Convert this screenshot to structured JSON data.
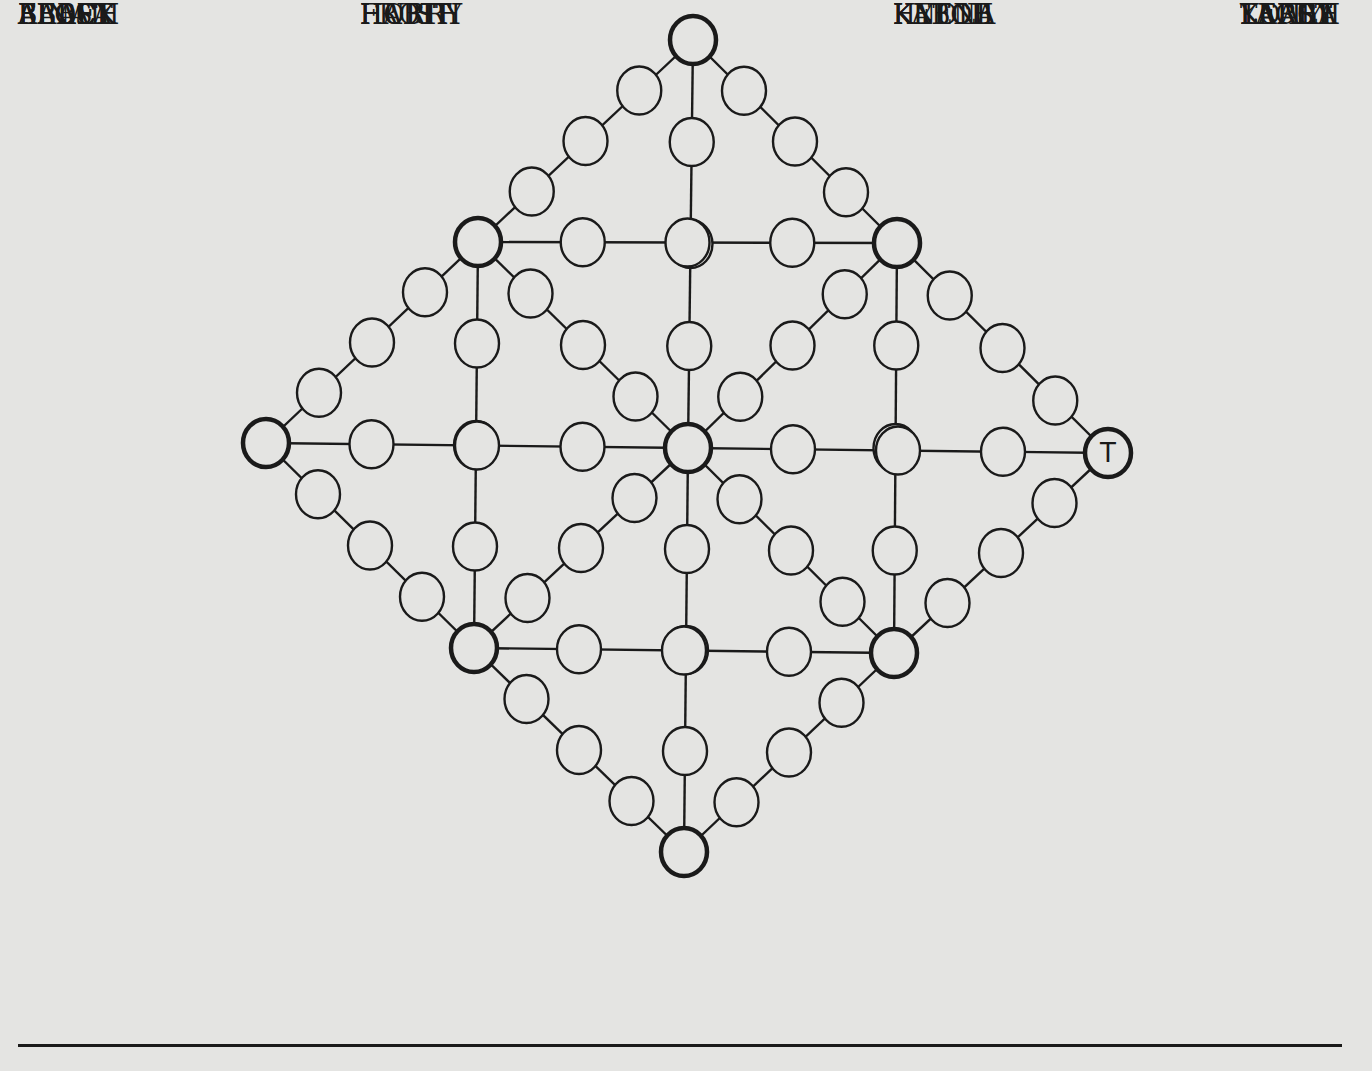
{
  "puzzle": {
    "type": "word-placement diamond grid",
    "given_letter": {
      "node": "R",
      "letter": "T"
    },
    "style": {
      "line_color": "#1a1a1a",
      "background": "#e4e4e2",
      "node_fill": "#e4e4e2"
    },
    "hubs": {
      "T": [
        693,
        40
      ],
      "UL": [
        478,
        242
      ],
      "UR": [
        897,
        243
      ],
      "L": [
        266,
        443
      ],
      "C": [
        688,
        448
      ],
      "R": [
        1108,
        453
      ],
      "LL": [
        474,
        648
      ],
      "LR": [
        894,
        653
      ],
      "B": [
        684,
        852
      ]
    },
    "paths": [
      [
        "T",
        "UL"
      ],
      [
        "T",
        "C"
      ],
      [
        "T",
        "UR"
      ],
      [
        "UL",
        "UR"
      ],
      [
        "UL",
        "L"
      ],
      [
        "UL",
        "C"
      ],
      [
        "UL",
        "LL"
      ],
      [
        "UR",
        "R"
      ],
      [
        "UR",
        "C"
      ],
      [
        "UR",
        "LR"
      ],
      [
        "L",
        "C"
      ],
      [
        "L",
        "LL"
      ],
      [
        "C",
        "R"
      ],
      [
        "C",
        "LL"
      ],
      [
        "C",
        "LR"
      ],
      [
        "C",
        "B"
      ],
      [
        "R",
        "LR"
      ],
      [
        "LL",
        "LR"
      ],
      [
        "LL",
        "B"
      ],
      [
        "LR",
        "B"
      ]
    ]
  },
  "word_list": {
    "columns": [
      {
        "x": 18,
        "words": [
          "ABBEY",
          "ALOFT",
          "BALSA",
          "BEACH",
          "FINAL",
          "FLOCK"
        ],
        "y": [
          655,
          724,
          793,
          863,
          934,
          1004
        ]
      },
      {
        "x": 360,
        "words": [
          "FROTH",
          "HABIT",
          "HOIST",
          "HURRY"
        ],
        "y": [
          797,
          867,
          938,
          1008
        ]
      },
      {
        "x": 893,
        "words": [
          "HYENA",
          "KABOB",
          "KETCH",
          "KNOLL"
        ],
        "y": [
          801,
          871,
          942,
          1012
        ]
      },
      {
        "x": 1240,
        "words": [
          "KOALA",
          "LAITY",
          "LARCH",
          "LEAST",
          "TERRY",
          "YACHT"
        ],
        "y": [
          665,
          735,
          804,
          874,
          945,
          1015
        ]
      }
    ]
  }
}
